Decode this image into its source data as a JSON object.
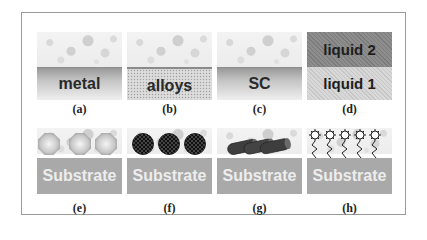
{
  "figure": {
    "panels": [
      {
        "id": "a",
        "caption": "(a)",
        "layers": [
          "metal"
        ],
        "description": "liquid over metal substrate"
      },
      {
        "id": "b",
        "caption": "(b)",
        "layers": [
          "alloys"
        ],
        "description": "liquid over alloy substrate"
      },
      {
        "id": "c",
        "caption": "(c)",
        "layers": [
          "SC"
        ],
        "description": "liquid over semiconductor"
      },
      {
        "id": "d",
        "caption": "(d)",
        "layers": [
          "liquid 2",
          "liquid 1"
        ],
        "description": "liquid-liquid interface"
      },
      {
        "id": "e",
        "caption": "(e)",
        "layers": [
          "Substrate"
        ],
        "description": "octahedral nanoparticles on substrate"
      },
      {
        "id": "f",
        "caption": "(f)",
        "layers": [
          "Substrate"
        ],
        "description": "checkered spherical nanoparticles on substrate"
      },
      {
        "id": "g",
        "caption": "(g)",
        "layers": [
          "Substrate"
        ],
        "description": "nanorods on substrate"
      },
      {
        "id": "h",
        "caption": "(h)",
        "layers": [
          "Substrate"
        ],
        "description": "ligand-capped molecules on substrate"
      }
    ]
  },
  "colors": {
    "frame": "#9a9a9a",
    "substrate": "#a9a9a9",
    "substrate_text": "#ededed",
    "liquid2": "#8d8d8d",
    "liquid1": "#d8d8d8"
  }
}
